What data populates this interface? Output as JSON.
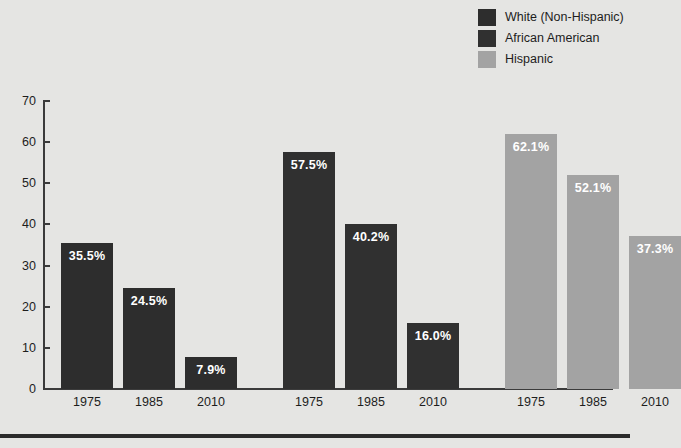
{
  "chart_data": {
    "type": "bar",
    "title": "",
    "xlabel": "",
    "ylabel": "",
    "ylim": [
      0,
      70
    ],
    "yticks": [
      0,
      10,
      20,
      30,
      40,
      50,
      60,
      70
    ],
    "grid": false,
    "legend_position": "top-right",
    "categories": [
      "1975",
      "1985",
      "2010"
    ],
    "series": [
      {
        "name": "White (Non-Hispanic)",
        "color": "#2d2d2d",
        "values": [
          35.5,
          24.5,
          7.9
        ],
        "labels": [
          "35.5%",
          "24.5%",
          "7.9%"
        ]
      },
      {
        "name": "African American",
        "color": "#303030",
        "values": [
          57.5,
          40.2,
          16.0
        ],
        "labels": [
          "57.5%",
          "40.2%",
          "16.0%"
        ]
      },
      {
        "name": "Hispanic",
        "color": "#a3a3a3",
        "values": [
          62.1,
          52.1,
          37.3
        ],
        "labels": [
          "62.1%",
          "52.1%",
          "37.3%"
        ]
      }
    ],
    "x_tick_labels": [
      "1975",
      "1985",
      "2010",
      "1975",
      "1985",
      "2010",
      "1975",
      "1985",
      "2010"
    ],
    "y_tick_labels": [
      "0",
      "10",
      "20",
      "30",
      "40",
      "50",
      "60",
      "70"
    ],
    "value_label_color": "#ffffff",
    "background_color": "#e5e5e3",
    "axis_color": "#3b3b3b"
  },
  "legend": {
    "items": [
      {
        "label": "White (Non-Hispanic)",
        "color": "#2d2d2d"
      },
      {
        "label": "African American",
        "color": "#303030"
      },
      {
        "label": "Hispanic",
        "color": "#a3a3a3"
      }
    ]
  }
}
